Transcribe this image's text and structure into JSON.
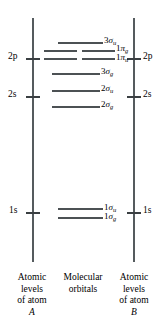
{
  "figure": {
    "type": "molecular-orbital-energy-level-diagram",
    "width": 165,
    "height": 329,
    "line_color": "#4c5154",
    "text_color": "#000000",
    "background": "#ffffff"
  },
  "left_axis": {
    "caption_lines": [
      "Atomic",
      "levels",
      "of atom"
    ],
    "atom_id": "A",
    "levels": [
      {
        "label": "2p",
        "y": 58
      },
      {
        "label": "2s",
        "y": 96
      },
      {
        "label": "1s",
        "y": 212
      }
    ]
  },
  "right_axis": {
    "caption_lines": [
      "Atomic",
      "levels",
      "of atom"
    ],
    "atom_id": "B",
    "levels": [
      {
        "label": "2p",
        "y": 58
      },
      {
        "label": "2s",
        "y": 96
      },
      {
        "label": "1s",
        "y": 212
      }
    ]
  },
  "center": {
    "caption_lines": [
      "Molecular",
      "orbitals"
    ]
  },
  "molecular_orbitals": [
    {
      "name": "3sigma-u",
      "number": "3",
      "symbol": "σ",
      "sub": "u",
      "label": "3σu",
      "y": 42,
      "degenerate": false
    },
    {
      "name": "1pi-g",
      "number": "1",
      "symbol": "π",
      "sub": "g",
      "label": "1πg",
      "y": 50,
      "degenerate": true
    },
    {
      "name": "1pi-u",
      "number": "1",
      "symbol": "π",
      "sub": "u",
      "label": "1πu",
      "y": 58,
      "degenerate": true
    },
    {
      "name": "3sigma-g",
      "number": "3",
      "symbol": "σ",
      "sub": "g",
      "label": "3σg",
      "y": 73,
      "degenerate": false
    },
    {
      "name": "2sigma-u",
      "number": "2",
      "symbol": "σ",
      "sub": "u",
      "label": "2σu",
      "y": 90,
      "degenerate": false
    },
    {
      "name": "2sigma-g",
      "number": "2",
      "symbol": "σ",
      "sub": "g",
      "label": "2σg",
      "y": 106,
      "degenerate": false
    },
    {
      "name": "1sigma-u",
      "number": "1",
      "symbol": "σ",
      "sub": "u",
      "label": "1σu",
      "y": 208,
      "degenerate": false
    },
    {
      "name": "1sigma-g",
      "number": "1",
      "symbol": "σ",
      "sub": "g",
      "label": "1σg",
      "y": 216,
      "degenerate": false
    }
  ]
}
